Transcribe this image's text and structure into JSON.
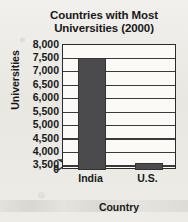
{
  "chart_data": {
    "type": "bar",
    "title": "Countries with Most Universities (2000)",
    "title_lines": [
      "Countries with Most",
      "Universities (2000)"
    ],
    "xlabel": "Country",
    "ylabel": "Universities",
    "categories": [
      "India",
      "U.S."
    ],
    "values": [
      7500,
      3600
    ],
    "ylim": [
      3350,
      8000
    ],
    "yticks": [
      8000,
      7500,
      7000,
      6500,
      6000,
      5500,
      5000,
      4500,
      4000,
      3500,
      0
    ],
    "ytick_labels": [
      "8,000",
      "7,500",
      "7,000",
      "6,500",
      "6,000",
      "5,500",
      "5,000",
      "4,500",
      "4,000",
      "3,500",
      "0"
    ],
    "grid": true,
    "legend": false,
    "axis_break": true,
    "axis_break_note": "y-axis broken between 0 and 3,500",
    "bar_color": "#4b4b4d",
    "plot_background": "#fbfaf7",
    "axis_color": "#2b2b2d"
  }
}
